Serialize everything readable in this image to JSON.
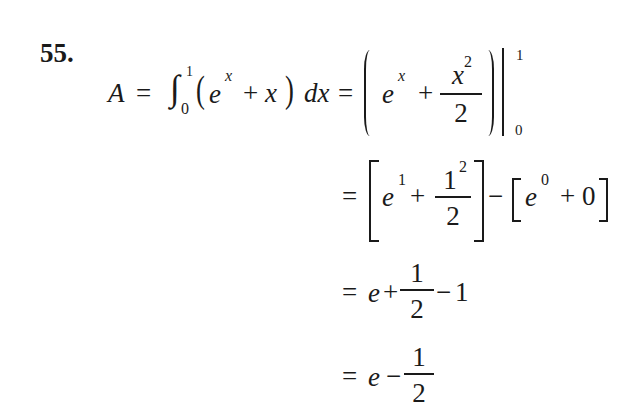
{
  "problem": {
    "number": "55.",
    "lines": [
      {
        "lhs": "A",
        "equals": "=",
        "integral": {
          "symbol": "∫",
          "lower": "0",
          "upper": "1"
        },
        "integrand": {
          "lparen": "(",
          "e": "e",
          "exp": "x",
          "plus": "+",
          "x": "x",
          "rparen": ")"
        },
        "dx": "dx",
        "equals2": "=",
        "antiderivative": {
          "e": "e",
          "exp": "x",
          "plus": "+",
          "frac_num": "x",
          "frac_num_exp": "2",
          "frac_den": "2"
        },
        "eval_upper": "1",
        "eval_lower": "0"
      },
      {
        "equals": "=",
        "first": {
          "e": "e",
          "exp": "1",
          "plus": "+",
          "frac_num": "1",
          "frac_num_exp": "2",
          "frac_den": "2"
        },
        "minus": "−",
        "second": {
          "e": "e",
          "exp": "0",
          "plus": "+",
          "zero": "0"
        }
      },
      {
        "equals": "=",
        "e": "e",
        "plus": "+",
        "frac_num": "1",
        "frac_den": "2",
        "minus": "−",
        "one": "1"
      },
      {
        "equals": "=",
        "e": "e",
        "minus": "−",
        "frac_num": "1",
        "frac_den": "2"
      }
    ]
  }
}
